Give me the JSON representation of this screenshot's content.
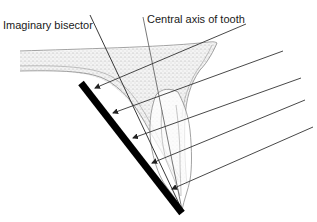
{
  "diagram": {
    "labels": {
      "bisector": "Imaginary bisector",
      "central_axis": "Central axis of tooth"
    },
    "elements": {
      "film": "X-ray film / receptor",
      "beams": "X-ray beams",
      "tooth": "Tooth",
      "tissue": "Soft tissue / alveolar bone"
    },
    "beam_count": 5,
    "colors": {
      "film": "#000000",
      "line": "#333333",
      "tissue_stipple": "#bdbdbd",
      "outline": "#8a8a8a"
    }
  }
}
